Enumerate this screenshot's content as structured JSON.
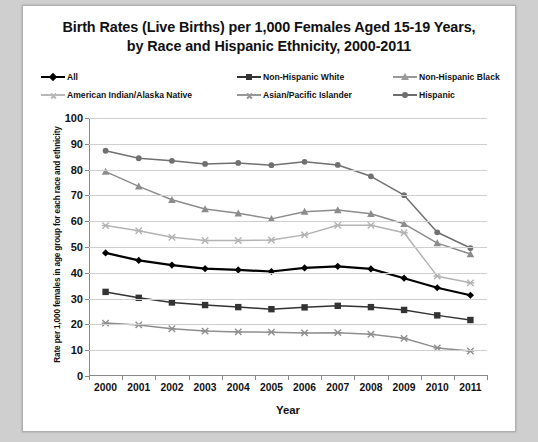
{
  "chart_data": {
    "type": "line",
    "title": "Birth Rates (Live Births) per 1,000 Females Aged 15-19 Years, by Race and Hispanic Ethnicity, 2000-2011",
    "title_line1": "Birth Rates (Live Births) per 1,000 Females Aged 15-19 Years,",
    "title_line2": "by Race and Hispanic Ethnicity, 2000-2011",
    "xlabel": "Year",
    "ylabel": "Rate per 1,000 females in age group for each race and ethnicity",
    "categories": [
      "2000",
      "2001",
      "2002",
      "2003",
      "2004",
      "2005",
      "2006",
      "2007",
      "2008",
      "2009",
      "2010",
      "2011"
    ],
    "yticks": [
      0,
      10,
      20,
      30,
      40,
      50,
      60,
      70,
      80,
      90,
      100
    ],
    "ylim": [
      0,
      100
    ],
    "grid": true,
    "legend_position": "top",
    "series": [
      {
        "name": "All",
        "marker": "diamond",
        "color": "#000000",
        "values": [
          47.7,
          44.8,
          43.0,
          41.6,
          41.1,
          40.5,
          41.9,
          42.5,
          41.5,
          37.9,
          34.2,
          31.3
        ]
      },
      {
        "name": "Non-Hispanic White",
        "marker": "square",
        "color": "#333333",
        "values": [
          32.6,
          30.3,
          28.5,
          27.5,
          26.7,
          25.9,
          26.6,
          27.2,
          26.7,
          25.6,
          23.5,
          21.7
        ]
      },
      {
        "name": "Non-Hispanic Black",
        "marker": "triangle",
        "color": "#8c8c8c",
        "values": [
          79.2,
          73.5,
          68.3,
          64.7,
          63.1,
          60.9,
          63.7,
          64.3,
          62.9,
          59.0,
          51.5,
          47.3
        ]
      },
      {
        "name": "American Indian/Alaska Native",
        "marker": "star",
        "color": "#b3b3b3",
        "values": [
          58.3,
          56.3,
          53.8,
          52.5,
          52.5,
          52.7,
          54.7,
          58.4,
          58.4,
          55.5,
          38.7,
          36.1
        ]
      },
      {
        "name": "Asian/Pacific Islander",
        "marker": "star",
        "color": "#8f8f8f",
        "values": [
          20.5,
          19.8,
          18.3,
          17.4,
          17.1,
          17.0,
          16.7,
          16.8,
          16.2,
          14.6,
          10.9,
          9.7
        ]
      },
      {
        "name": "Hispanic",
        "marker": "circle",
        "color": "#707070",
        "values": [
          87.3,
          84.4,
          83.4,
          82.2,
          82.6,
          81.7,
          83.0,
          81.8,
          77.4,
          70.1,
          55.7,
          49.6
        ]
      }
    ]
  },
  "legend": {
    "items": [
      {
        "label": "All",
        "marker": "diamond",
        "color": "#000000"
      },
      {
        "label": "Non-Hispanic White",
        "marker": "square",
        "color": "#333333"
      },
      {
        "label": "Non-Hispanic Black",
        "marker": "triangle",
        "color": "#9a9a9a"
      },
      {
        "label": "American Indian/Alaska Native",
        "marker": "star",
        "color": "#b8b8b8"
      },
      {
        "label": "Asian/Pacific Islander",
        "marker": "star",
        "color": "#969696"
      },
      {
        "label": "Hispanic",
        "marker": "circle",
        "color": "#6e6e6e"
      }
    ]
  },
  "colors": {
    "grid": "#cfcfcf",
    "axis": "#8a8a8a",
    "text": "#111111",
    "plot_background": "#ffffff",
    "page_background": "#cfcfcf"
  }
}
